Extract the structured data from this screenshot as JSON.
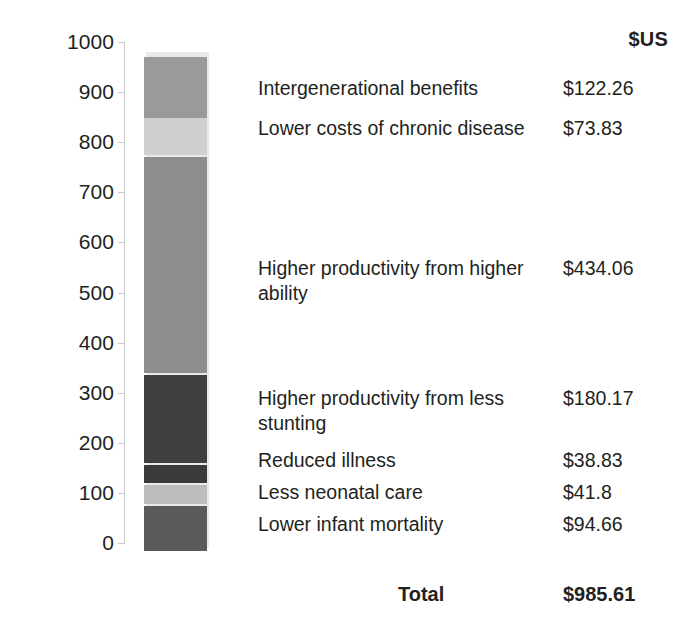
{
  "chart_data": {
    "type": "bar",
    "subtype": "stacked-bar-single-column",
    "title": "",
    "xlabel": "",
    "ylabel": "",
    "ylim": [
      0,
      1000
    ],
    "yticks": [
      0,
      100,
      200,
      300,
      400,
      500,
      600,
      700,
      800,
      900,
      1000
    ],
    "ytick_labels": [
      "0",
      "100",
      "200",
      "300",
      "400",
      "500",
      "600",
      "700",
      "800",
      "900",
      "1000"
    ],
    "grid": false,
    "legend": "right-labels",
    "unit_header": "$US",
    "categories": [
      "Intergenerational benefits",
      "Lower costs of chronic disease",
      "Higher productivity from higher ability",
      "Higher productivity from less stunting",
      "Reduced illness",
      "Less neonatal care",
      "Lower infant mortality"
    ],
    "values": [
      122.26,
      73.83,
      434.06,
      180.17,
      38.83,
      41.8,
      94.66
    ],
    "value_labels": [
      "$122.26",
      "$73.83",
      "$434.06",
      "$180.17",
      "$38.83",
      "$41.8",
      "$94.66"
    ],
    "colors": [
      "#9a9a9a",
      "#cfcfcf",
      "#8e8e8e",
      "#3f3f3f",
      "#3a3a3a",
      "#bdbdbd",
      "#5a5a5a"
    ],
    "total": 985.61,
    "total_label": "$985.61",
    "total_text": "Total"
  },
  "axis": {
    "ticks": [
      {
        "label": "1000",
        "value": 1000
      },
      {
        "label": "900",
        "value": 900
      },
      {
        "label": "800",
        "value": 800
      },
      {
        "label": "700",
        "value": 700
      },
      {
        "label": "600",
        "value": 600
      },
      {
        "label": "500",
        "value": 500
      },
      {
        "label": "400",
        "value": 400
      },
      {
        "label": "300",
        "value": 300
      },
      {
        "label": "200",
        "value": 200
      },
      {
        "label": "100",
        "value": 100
      },
      {
        "label": "0",
        "value": 0
      }
    ]
  },
  "table": {
    "unit_header": "$US",
    "rows": [
      {
        "label": "Intergenerational benefits",
        "amount": "$122.26"
      },
      {
        "label": "Lower costs of chronic disease",
        "amount": "$73.83"
      },
      {
        "label": "Higher productivity from higher ability",
        "amount": "$434.06"
      },
      {
        "label": "Higher productivity from less stunting",
        "amount": "$180.17"
      },
      {
        "label": "Reduced illness",
        "amount": "$38.83"
      },
      {
        "label": "Less neonatal care",
        "amount": "$41.8"
      },
      {
        "label": "Lower infant mortality",
        "amount": "$94.66"
      }
    ],
    "total": {
      "label": "Total",
      "amount": "$985.61"
    }
  },
  "style": {
    "axis_color": "#c9c9c9",
    "text_color": "#231f20",
    "background": "#ffffff"
  }
}
